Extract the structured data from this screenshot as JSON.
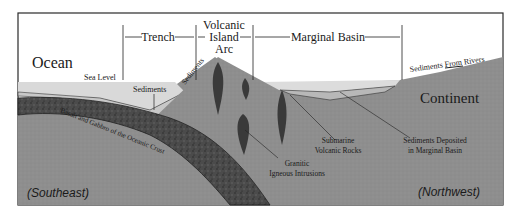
{
  "diagram": {
    "title_labels": {
      "ocean": "Ocean",
      "continent": "Continent",
      "sea_level": "Sea Level",
      "sediments_trench": "Sediments",
      "sediments_slope": "Sediments",
      "sediments_rivers": "Sediments From Rivers",
      "submarine_1": "Submarine",
      "submarine_2": "Volcanic Rocks",
      "deposited_1": "Sediments Deposited",
      "deposited_2": "in Marginal Basin",
      "granitic_1": "Granitic",
      "granitic_2": "Igneous Intrusions",
      "slab": "Basalt and Gabbro of the Oceanic Crust",
      "southeast": "(Southeast)",
      "northwest": "(Northwest)"
    },
    "zones": [
      {
        "label": "Trench"
      },
      {
        "label_lines": [
          "Volcanic",
          "Island",
          "Arc"
        ]
      },
      {
        "label": "Marginal Basin"
      }
    ],
    "colors": {
      "frame": "#2a2a2a",
      "crust": "#8f8f8f",
      "slab": "#4a4a4a",
      "sea": "#d9d9d9",
      "sediment": "#b8b8b8",
      "intrusion": "#3a3a3a",
      "sky": "#ffffff"
    }
  }
}
